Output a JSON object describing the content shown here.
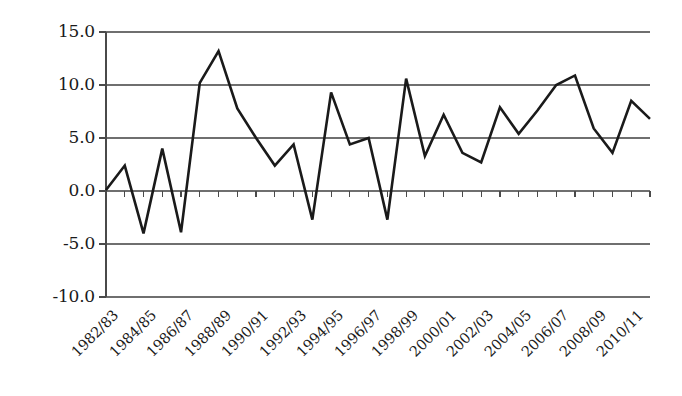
{
  "chart_data": {
    "type": "line",
    "title": "",
    "subtitle": "",
    "xlabel": "",
    "ylabel": "",
    "grid": true,
    "legend": false,
    "legend_position": "none",
    "line_color": "#1a1a1a",
    "grid_color": "#6f6f6f",
    "axis_color": "#4a4a4a",
    "background_color": "#ffffff",
    "ylim": [
      -10.0,
      15.0
    ],
    "ytick_labels": [
      "15.0",
      "10.0",
      "5.0",
      "0.0",
      "-5.0",
      "-10.0"
    ],
    "ytick_values": [
      15.0,
      10.0,
      5.0,
      0.0,
      -5.0,
      -10.0
    ],
    "x": [
      "1982/83",
      "1983/84",
      "1984/85",
      "1985/86",
      "1986/87",
      "1987/88",
      "1988/89",
      "1989/90",
      "1990/91",
      "1991/92",
      "1992/93",
      "1993/94",
      "1994/95",
      "1995/96",
      "1996/97",
      "1997/98",
      "1998/99",
      "1999/00",
      "2000/01",
      "2001/02",
      "2002/03",
      "2003/04",
      "2004/05",
      "2005/06",
      "2006/07",
      "2007/08",
      "2008/09",
      "2009/10",
      "2010/11",
      "2011/12"
    ],
    "xtick_labels": [
      "1982/83",
      "1984/85",
      "1986/87",
      "1988/89",
      "1990/91",
      "1992/93",
      "1994/95",
      "1996/97",
      "1998/99",
      "2000/01",
      "2002/03",
      "2004/05",
      "2006/07",
      "2008/09",
      "2010/11"
    ],
    "xtick_label_indices": [
      0,
      2,
      4,
      6,
      8,
      10,
      12,
      14,
      16,
      18,
      20,
      22,
      24,
      26,
      28
    ],
    "values": [
      0.1,
      2.4,
      -4.0,
      4.0,
      -3.9,
      10.2,
      13.2,
      7.8,
      5.0,
      2.4,
      4.4,
      -2.7,
      9.3,
      4.4,
      5.0,
      -2.7,
      10.6,
      3.3,
      7.2,
      3.6,
      2.7,
      7.9,
      5.4,
      7.6,
      10.0,
      10.9,
      5.9,
      3.6,
      8.5,
      6.8
    ]
  }
}
